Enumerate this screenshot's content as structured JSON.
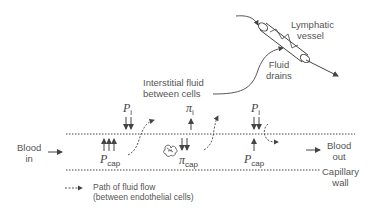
{
  "diagram": {
    "labels": {
      "lymphatic_vessel": [
        "Lymphatic",
        "vessel"
      ],
      "fluid_drains": [
        "Fluid",
        "drains"
      ],
      "interstitial_fluid": [
        "Interstitial fluid",
        "between cells"
      ],
      "blood_in": [
        "Blood",
        "in"
      ],
      "blood_out": [
        "Blood",
        "out"
      ],
      "capillary_wall": [
        "Capillary",
        "wall"
      ],
      "legend": [
        "Path of fluid flow",
        "(between endothelial cells)"
      ]
    },
    "symbols": {
      "p_i_left": {
        "main": "P",
        "sub": "i"
      },
      "pi_i": {
        "main": "π",
        "sub": "i"
      },
      "p_i_right": {
        "main": "P",
        "sub": "i"
      },
      "p_cap_left": {
        "main": "P",
        "sub": "cap"
      },
      "pi_cap": {
        "main": "π",
        "sub": "cap"
      },
      "p_cap_right": {
        "main": "P",
        "sub": "cap"
      }
    },
    "colors": {
      "line": "#444444",
      "text": "#555555"
    }
  }
}
